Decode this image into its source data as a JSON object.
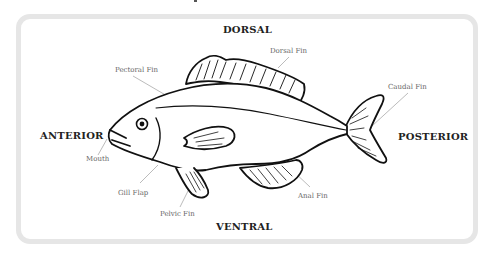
{
  "diagram": {
    "directions": {
      "dorsal": "DORSAL",
      "ventral": "VENTRAL",
      "anterior": "ANTERIOR",
      "posterior": "POSTERIOR"
    },
    "labels": {
      "dorsal_fin": "Dorsal Fin",
      "pectoral_fin": "Pectoral Fin",
      "caudal_fin": "Caudal Fin",
      "mouth": "Mouth",
      "gill_flap": "Gill Flap",
      "pelvic_fin": "Pelvic Fin",
      "anal_fin": "Anal Fin"
    },
    "colors": {
      "outline": "#111111",
      "leader_line": "#aaaaaa",
      "frame": "#e6e6e6",
      "label_text": "#666666",
      "direction_text": "#222222"
    }
  }
}
